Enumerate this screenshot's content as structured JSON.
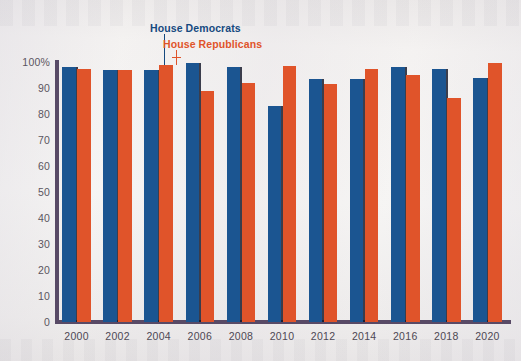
{
  "chart_data": {
    "type": "bar",
    "title": "",
    "xlabel": "",
    "ylabel": "",
    "ylim": [
      0,
      100
    ],
    "grid": false,
    "legend_position": "top-center-callout",
    "categories": [
      "2000",
      "2002",
      "2004",
      "2006",
      "2008",
      "2010",
      "2012",
      "2014",
      "2016",
      "2018",
      "2020"
    ],
    "ytick_labels": [
      "100%",
      "90",
      "80",
      "70",
      "60",
      "50",
      "40",
      "30",
      "20",
      "10",
      "0"
    ],
    "ytick_values": [
      100,
      90,
      80,
      70,
      60,
      50,
      40,
      30,
      20,
      10,
      0
    ],
    "series": [
      {
        "name": "House Democrats",
        "color": "#1b5591",
        "values": [
          98,
          97,
          97,
          99.5,
          98,
          83,
          93.5,
          93.5,
          98,
          97.5,
          94
        ]
      },
      {
        "name": "House Republicans",
        "color": "#e0542a",
        "values": [
          97.5,
          97,
          99,
          89,
          92,
          98.5,
          91.5,
          97.5,
          95,
          86,
          99.5
        ]
      }
    ]
  },
  "legend": {
    "democrats_label": "House Democrats",
    "republicans_label": "House Republicans"
  },
  "colors": {
    "democrat_blue": "#1b5591",
    "republican_orange": "#e0542a",
    "axis_purple": "#584a66",
    "background": "#f2f0ee"
  }
}
